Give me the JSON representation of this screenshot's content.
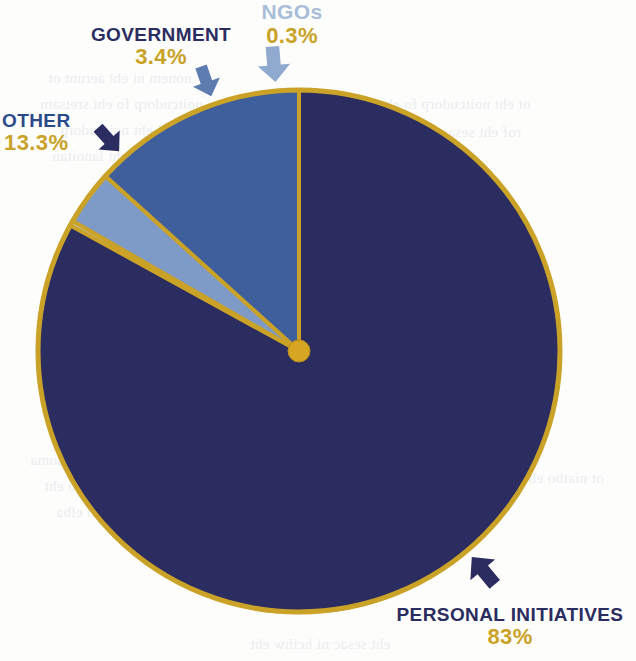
{
  "chart_data": {
    "type": "pie",
    "title": "",
    "subtitle": "",
    "xlabel": "",
    "ylabel": "",
    "legend_position": "callout-labels",
    "grid": false,
    "start_angle_deg": 0,
    "direction": "clockwise",
    "categories": [
      "PERSONAL INITIATIVES",
      "NGOs",
      "GOVERNMENT",
      "OTHER"
    ],
    "values": [
      83,
      0.3,
      3.4,
      13.3
    ],
    "value_labels": [
      "83%",
      "0.3%",
      "3.4%",
      "13.3%"
    ],
    "slices": [
      {
        "name": "PERSONAL INITIATIVES",
        "value": 83,
        "value_label": "83%",
        "color": "#2b2c60",
        "label_color": "#2b2c60",
        "pct_color": "#c9a227",
        "pointer": "arrow-down-right"
      },
      {
        "name": "NGOs",
        "value": 0.3,
        "value_label": "0.3%",
        "color": "#bed0e6",
        "label_color": "#a8bdd8",
        "pct_color": "#c9a227",
        "pointer": "arrow-up"
      },
      {
        "name": "GOVERNMENT",
        "value": 3.4,
        "value_label": "3.4%",
        "color": "#7e9ac6",
        "label_color": "#2b2c60",
        "pct_color": "#c9a227",
        "pointer": "arrow-up"
      },
      {
        "name": "OTHER",
        "value": 13.3,
        "value_label": "13.3%",
        "color": "#3f5f9c",
        "label_color": "#2b4a8a",
        "pct_color": "#c9a227",
        "pointer": "arrow-up-left"
      }
    ],
    "geometry": {
      "center_x": 299,
      "center_y": 351,
      "radius": 261,
      "hub_radius": 11
    },
    "colors": {
      "outline": "#c9a227",
      "hub": "#d6a623",
      "background": "#fdfdfb",
      "navy": "#2b2c60",
      "mid_blue": "#3f5f9c",
      "light_blue": "#7e9ac6",
      "pale_blue": "#bed0e6",
      "gold": "#c9a227"
    }
  },
  "labels": {
    "other": {
      "name": "OTHER",
      "pct": "13.3%"
    },
    "government": {
      "name": "GOVERNMENT",
      "pct": "3.4%"
    },
    "ngos": {
      "name": "NGOs",
      "pct": "0.3%"
    },
    "personal": {
      "name": "PERSONAL INITIATIVES",
      "pct": "83%"
    }
  },
  "background_bleed": {
    "lines": [
      "nonem  ni  eht  aerunt  ot",
      "noitcudorp  fo  eht  sretsam",
      "sruoh  ni  eht  noitcudorp",
      "ni  gnidulcni  eht  lanoitan",
      "ot  eht  noitcudorp  fo  eht",
      "rof  eht  sesac  fo  emos",
      "taht  eht  lanoitan  tnuoma",
      "si  deredisnoc  ot  eb  eht",
      "ew  evah  ton  neeb  elba",
      "ot  niatbo  eht  atad  rof",
      "eht  sesac  ni  hcihw  eht"
    ]
  }
}
